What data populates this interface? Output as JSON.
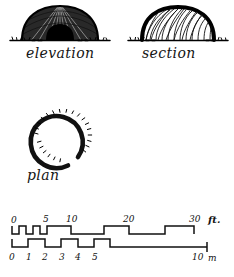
{
  "document": {
    "type": "architectural-hand-drawing",
    "subject": "domed thatched hut",
    "background_color": "#ffffff",
    "ink_color": "#111111"
  },
  "figures": [
    {
      "id": "elevation",
      "caption": "elevation",
      "description": "front view of domed hut with dark entrance opening and ground line"
    },
    {
      "id": "section",
      "caption": "section",
      "description": "cross section of dome showing radial structural ribs and ground line"
    },
    {
      "id": "plan",
      "caption": "plan",
      "description": "circular plan with gap at lower right for entrance"
    }
  ],
  "captions": {
    "elevation": "elevation",
    "section": "section",
    "plan": "plan"
  },
  "scale_bar": {
    "name": "graphic-scale",
    "feet": {
      "unit_label": "ft.",
      "ticks": [
        "0",
        "5",
        "10",
        "20",
        "30"
      ],
      "tick_values": [
        0,
        5,
        10,
        20,
        30
      ],
      "tick_x": [
        12,
        44,
        68,
        126,
        192
      ]
    },
    "meters": {
      "unit_label": "m",
      "ticks": [
        "0",
        "1",
        "2",
        "3",
        "4",
        "5",
        "10"
      ],
      "tick_values": [
        0,
        1,
        2,
        3,
        4,
        5,
        10
      ],
      "tick_x": [
        12,
        45,
        78,
        110,
        142,
        173,
        205
      ]
    }
  }
}
